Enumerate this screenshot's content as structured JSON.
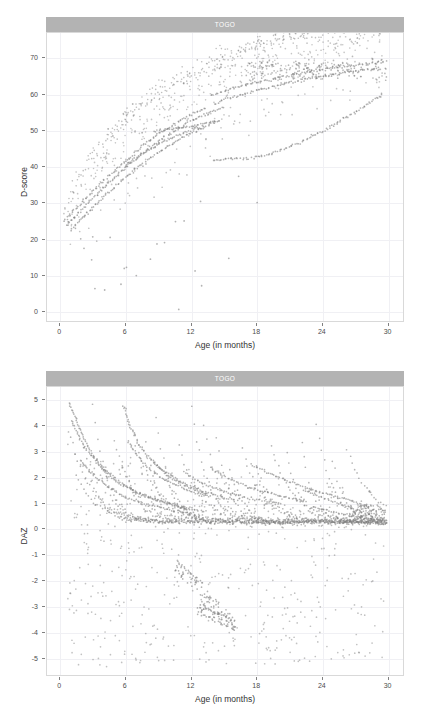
{
  "figure": {
    "panel_count": 2,
    "strip_color": "#b3b3b3",
    "point_color": "#808080",
    "grid_color": "#f0f0f4"
  },
  "panels": [
    {
      "strip_label": "TOGO",
      "ylabel": "DAZ-placeholder"
    }
  ],
  "chart_data": [
    {
      "type": "scatter",
      "title": "TOGO",
      "strip_label": "TOGO",
      "xlabel": "Age (in months)",
      "ylabel": "D-score",
      "xlim": [
        -1.2,
        31.5
      ],
      "ylim": [
        -3.0,
        77.0
      ],
      "xticks": [
        0,
        6,
        12,
        18,
        24,
        30
      ],
      "yticks": [
        0,
        10,
        20,
        30,
        40,
        50,
        60,
        70
      ],
      "xtick_labels": [
        "0",
        "6",
        "12",
        "18",
        "24",
        "30"
      ],
      "ytick_labels": [
        "0",
        "10",
        "20",
        "30",
        "40",
        "50",
        "60",
        "70"
      ],
      "grid": true,
      "legend": "none",
      "marker": {
        "shape": "circle",
        "color": "#808080",
        "size": 1.1,
        "alpha": 0.55
      },
      "description": "D-score increases steeply from about 24 at birth to about 69 by 30 months; dense overlapping child trajectories form thick arcs, with a wide scatter of lower outliers.",
      "trajectories": [
        {
          "x": [
            0.4,
            1.2,
            2.1,
            3.0,
            4.1,
            5.2,
            6.3,
            7.4,
            8.6,
            9.8,
            11.0,
            12.2,
            13.5
          ],
          "y": [
            24.6,
            27.4,
            30.2,
            33.0,
            36.4,
            39.3,
            42.0,
            45.2,
            48.0,
            50.4,
            52.6,
            54.6,
            56.2
          ]
        },
        {
          "x": [
            0.6,
            1.5,
            2.4,
            3.4,
            4.5,
            5.6,
            6.8,
            8.0,
            9.2,
            10.5,
            11.8,
            13.0,
            14.3,
            15.2
          ],
          "y": [
            23.4,
            26.5,
            29.4,
            32.3,
            35.5,
            38.6,
            41.5,
            44.6,
            47.3,
            49.8,
            52.1,
            54.0,
            55.6,
            56.6
          ]
        },
        {
          "x": [
            1.0,
            2.0,
            3.1,
            4.2,
            5.4,
            6.6,
            7.9,
            9.2,
            10.6,
            12.0,
            13.4,
            14.6
          ],
          "y": [
            22.0,
            25.6,
            28.8,
            32.0,
            35.3,
            38.4,
            41.4,
            44.3,
            46.9,
            49.2,
            51.2,
            52.8
          ]
        },
        {
          "x": [
            13.8,
            15.0,
            16.3,
            17.6,
            19.0,
            20.4,
            21.8,
            23.2,
            24.6,
            26.0,
            27.4,
            28.8,
            29.8
          ],
          "y": [
            59.8,
            61.0,
            62.0,
            63.0,
            63.9,
            64.8,
            65.6,
            66.3,
            67.0,
            67.6,
            68.1,
            68.6,
            69.0
          ]
        },
        {
          "x": [
            14.2,
            15.4,
            16.8,
            18.2,
            19.6,
            21.0,
            22.4,
            23.8,
            25.2,
            26.6,
            28.0,
            29.4
          ],
          "y": [
            57.4,
            58.8,
            60.0,
            61.1,
            62.1,
            63.1,
            64.0,
            64.8,
            65.5,
            66.2,
            66.8,
            67.4
          ]
        },
        {
          "x": [
            14.0,
            15.6,
            17.2,
            18.8,
            20.4,
            22.0,
            23.6,
            25.2,
            26.8,
            28.4,
            29.8
          ],
          "y": [
            41.6,
            42.0,
            42.2,
            43.0,
            44.6,
            46.6,
            49.0,
            51.6,
            54.4,
            57.6,
            60.4
          ]
        },
        {
          "x": [
            6.0,
            7.2,
            8.4,
            9.6,
            10.8,
            12.0,
            13.2
          ],
          "y": [
            40.2,
            42.8,
            45.0,
            47.0,
            48.6,
            50.0,
            51.2
          ]
        },
        {
          "x": [
            8.6,
            9.8,
            11.0,
            12.3,
            13.6,
            14.8
          ],
          "y": [
            49.6,
            50.2,
            50.6,
            51.2,
            52.0,
            52.8
          ]
        }
      ],
      "scatter_cloud": {
        "n_points": 900,
        "note": "broad scatter of individual measurements beneath and around the main trajectory band, including low outliers near 0-20 D-score between 3 and 13 months"
      }
    },
    {
      "type": "scatter",
      "title": "TOGO",
      "strip_label": "TOGO",
      "xlabel": "Age (in months)",
      "ylabel": "DAZ",
      "xlim": [
        -1.2,
        31.5
      ],
      "ylim": [
        -5.7,
        5.5
      ],
      "xticks": [
        0,
        6,
        12,
        18,
        24,
        30
      ],
      "yticks": [
        -5,
        -4,
        -3,
        -2,
        -1,
        0,
        1,
        2,
        3,
        4,
        5
      ],
      "xtick_labels": [
        "0",
        "6",
        "12",
        "18",
        "24",
        "30"
      ],
      "ytick_labels": [
        "-5",
        "-4",
        "-3",
        "-2",
        "-1",
        "0",
        "1",
        "2",
        "3",
        "4",
        "5"
      ],
      "grid": true,
      "legend": "none",
      "marker": {
        "shape": "circle",
        "color": "#808080",
        "size": 1.1,
        "alpha": 0.55
      },
      "description": "DAZ declines with age; many child trajectories start high (up to about 5 at 1 month) and decay toward roughly 0.2 by 30 months, while a diffuse cloud of negative values spreads down to about -5.",
      "trajectories": [
        {
          "x": [
            0.8,
            1.2,
            1.7,
            2.2,
            2.8,
            3.5,
            4.3,
            5.2,
            6.2,
            7.4,
            8.8,
            10.4,
            12.2
          ],
          "y": [
            4.9,
            4.5,
            4.0,
            3.5,
            3.0,
            2.6,
            2.2,
            1.9,
            1.6,
            1.35,
            1.1,
            0.9,
            0.7
          ]
        },
        {
          "x": [
            1.1,
            1.6,
            2.2,
            2.9,
            3.7,
            4.6,
            5.6,
            6.8,
            8.2,
            9.8,
            11.6,
            13.6
          ],
          "y": [
            4.2,
            3.7,
            3.2,
            2.8,
            2.4,
            2.0,
            1.7,
            1.45,
            1.2,
            1.0,
            0.8,
            0.65
          ]
        },
        {
          "x": [
            2.0,
            2.6,
            3.3,
            4.1,
            5.0,
            6.1,
            7.4,
            8.9,
            10.6,
            12.5
          ],
          "y": [
            2.6,
            2.3,
            2.0,
            1.7,
            1.45,
            1.2,
            1.0,
            0.85,
            0.7,
            0.55
          ]
        },
        {
          "x": [
            5.8,
            6.4,
            7.2,
            8.1,
            9.2,
            10.5,
            12.0,
            13.7
          ],
          "y": [
            4.8,
            4.0,
            3.3,
            2.8,
            2.3,
            1.9,
            1.55,
            1.3
          ]
        },
        {
          "x": [
            6.2,
            7.0,
            8.0,
            9.2,
            10.6,
            12.2,
            14.0
          ],
          "y": [
            3.4,
            2.9,
            2.4,
            2.0,
            1.7,
            1.4,
            1.2
          ]
        },
        {
          "x": [
            8.6,
            9.4,
            10.4,
            11.6,
            13.0,
            14.6,
            16.4
          ],
          "y": [
            2.6,
            2.3,
            2.0,
            1.7,
            1.45,
            1.25,
            1.05
          ]
        },
        {
          "x": [
            11.4,
            12.4,
            13.6,
            15.0,
            16.6,
            18.4,
            20.4
          ],
          "y": [
            2.2,
            1.9,
            1.65,
            1.45,
            1.25,
            1.1,
            0.95
          ]
        },
        {
          "x": [
            13.8,
            14.8,
            16.0,
            17.4,
            19.0,
            20.8,
            22.8
          ],
          "y": [
            2.35,
            2.1,
            1.85,
            1.6,
            1.4,
            1.2,
            1.05
          ]
        },
        {
          "x": [
            17.6,
            18.8,
            20.2,
            21.8,
            23.6,
            25.6,
            27.8,
            29.8
          ],
          "y": [
            2.5,
            2.2,
            1.95,
            1.7,
            1.45,
            1.2,
            0.95,
            0.3
          ]
        },
        {
          "x": [
            22.4,
            23.8,
            25.4,
            27.0,
            28.6,
            29.9
          ],
          "y": [
            1.5,
            1.25,
            1.0,
            0.75,
            0.5,
            0.25
          ]
        },
        {
          "x": [
            23.2,
            24.6,
            26.2,
            27.8,
            29.4
          ],
          "y": [
            0.85,
            0.7,
            0.55,
            0.4,
            0.25
          ]
        },
        {
          "x": [
            10.8,
            11.6,
            12.4,
            13.2
          ],
          "y": [
            -1.3,
            -1.6,
            -1.9,
            -2.2
          ]
        },
        {
          "x": [
            13.0,
            13.8,
            14.6,
            15.4
          ],
          "y": [
            -2.9,
            -3.2,
            -3.35,
            -3.4
          ]
        }
      ],
      "scatter_cloud": {
        "n_points": 900,
        "note": "diffuse cloud of single observations from about +3.5 down to -5.3 across the whole age range, densest between 0 and 2 DAZ"
      }
    }
  ],
  "axes": {
    "x_title": "Age (in months)",
    "y_title_top": "D-score",
    "y_title_bottom": "DAZ"
  }
}
